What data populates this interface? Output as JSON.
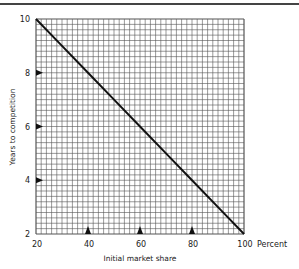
{
  "chart_data": {
    "type": "line",
    "title": "",
    "xlabel": "Initial market share",
    "ylabel": "Years to competition",
    "x_unit_label": "Percent",
    "xlim": [
      20,
      100
    ],
    "ylim": [
      2,
      10
    ],
    "x_ticks": [
      20,
      40,
      60,
      80,
      100
    ],
    "y_ticks": [
      2,
      4,
      6,
      8,
      10
    ],
    "x_tick_labels": [
      "20",
      "40",
      "60",
      "80",
      "100"
    ],
    "y_tick_labels": [
      "2",
      "4",
      "6",
      "8",
      "10"
    ],
    "grid": true,
    "grid_minor_step_x": 2,
    "grid_minor_step_y": 0.2,
    "x_markers": [
      40,
      60,
      80
    ],
    "y_markers": [
      4,
      6,
      8
    ],
    "legend": null,
    "series": [
      {
        "name": "Years to competition",
        "x": [
          20,
          30,
          40,
          50,
          60,
          70,
          80,
          90,
          100
        ],
        "values": [
          10,
          9,
          8,
          7,
          6,
          5,
          4,
          3,
          2
        ]
      }
    ]
  },
  "labels": {
    "xlabel": "Initial market share",
    "ylabel": "Years to competition",
    "x_unit": "Percent",
    "x_ticks": [
      "20",
      "40",
      "60",
      "80",
      "100"
    ],
    "y_ticks": [
      "10",
      "8",
      "6",
      "4",
      "2"
    ]
  },
  "colors": {
    "grid": "#555555",
    "line": "#111111",
    "text": "#222222",
    "background": "#ffffff"
  }
}
